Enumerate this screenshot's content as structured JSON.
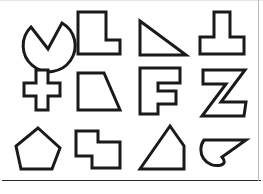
{
  "page": {
    "background_color": "#ffffff",
    "outline_color": "#1a1a1a",
    "fill_color": "#ffffff",
    "width": 263,
    "height": 194,
    "rules": {
      "bottom_rule_label": "page-bottom-rule",
      "right_rule_label": "page-right-edge-rule",
      "top_rule_label": "page-top-edge-rule"
    }
  },
  "grid": {
    "columns": 4,
    "rows": 3,
    "count": 12
  },
  "shapes": [
    {
      "index": 1,
      "row": 1,
      "column": 1,
      "name": "circle-with-v-notch",
      "label": "Circle with V notch",
      "x": 12,
      "y": 9,
      "w": 53,
      "h": 50,
      "type": "path",
      "d": "M 19 18 L 36 40 L 50 14 A 26 26 0 1 1 19 18 Z"
    },
    {
      "index": 2,
      "row": 1,
      "column": 2,
      "name": "l-shape",
      "label": "L shape",
      "x": 76,
      "y": 10,
      "w": 46,
      "h": 46,
      "type": "polygon",
      "points": "2,2 30,2 30,30 44,30 44,44 2,44"
    },
    {
      "index": 3,
      "row": 1,
      "column": 3,
      "name": "right-triangle",
      "label": "Right triangle",
      "x": 138,
      "y": 19,
      "w": 50,
      "h": 38,
      "type": "polygon",
      "points": "2,2 48,36 2,36"
    },
    {
      "index": 4,
      "row": 1,
      "column": 4,
      "name": "t-shape",
      "label": "T shape",
      "x": 198,
      "y": 10,
      "w": 48,
      "h": 46,
      "type": "polygon",
      "points": "16,2 32,2 32,27 46,27 46,44 2,44 2,27 16,27"
    },
    {
      "index": 5,
      "row": 2,
      "column": 1,
      "name": "plus-cross-shape",
      "label": "Plus cross",
      "x": 22,
      "y": 68,
      "w": 40,
      "h": 44,
      "type": "polygon",
      "points": "14,2 26,2 26,15 38,15 38,28 26,28 26,42 14,42 14,28 2,28 2,15 14,15"
    },
    {
      "index": 6,
      "row": 2,
      "column": 2,
      "name": "right-trapezoid",
      "label": "Right trapezoid",
      "x": 76,
      "y": 71,
      "w": 46,
      "h": 41,
      "type": "polygon",
      "points": "2,2 28,2 44,39 2,39"
    },
    {
      "index": 7,
      "row": 2,
      "column": 3,
      "name": "letter-f-shape",
      "label": "Letter F",
      "x": 138,
      "y": 66,
      "w": 44,
      "h": 50,
      "type": "polygon",
      "points": "2,2 42,2 42,17 20,17 20,25 38,25 38,38 20,38 20,48 2,48"
    },
    {
      "index": 8,
      "row": 2,
      "column": 4,
      "name": "letter-z-shape",
      "label": "Letter Z",
      "x": 200,
      "y": 68,
      "w": 48,
      "h": 50,
      "type": "polygon",
      "points": "3,2 45,2 21,34 46,34 44,48 2,48 26,16 3,16"
    },
    {
      "index": 9,
      "row": 3,
      "column": 1,
      "name": "pentagon-shape",
      "label": "Pentagon",
      "x": 14,
      "y": 126,
      "w": 48,
      "h": 45,
      "type": "polygon",
      "points": "24,2 46,22 38,43 7,43 2,20"
    },
    {
      "index": 10,
      "row": 3,
      "column": 2,
      "name": "stepped-polygon",
      "label": "Stepped polygon",
      "x": 74,
      "y": 129,
      "w": 48,
      "h": 41,
      "type": "polygon",
      "points": "2,2 24,2 24,13 46,13 46,39 18,39 18,27 2,27"
    },
    {
      "index": 11,
      "row": 3,
      "column": 3,
      "name": "wedge-house-shape",
      "label": "Wedge house shape",
      "x": 138,
      "y": 124,
      "w": 50,
      "h": 47,
      "type": "polygon",
      "points": "32,2 46,22 46,45 2,45"
    },
    {
      "index": 12,
      "row": 3,
      "column": 4,
      "name": "curved-hook-shape",
      "label": "Curved hook",
      "x": 200,
      "y": 132,
      "w": 50,
      "h": 36,
      "type": "path",
      "d": "M 4 8 L 46 8 L 22 25 Q 27 31 21 33 A 16 16 0 0 1 4 8 Z"
    }
  ]
}
